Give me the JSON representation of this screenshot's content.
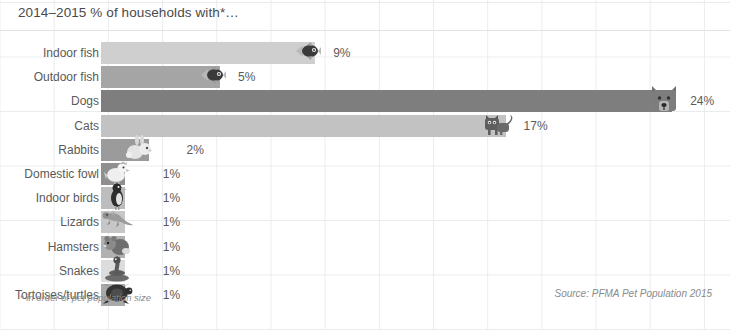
{
  "chart_data": {
    "type": "bar",
    "orientation": "horizontal",
    "title": "2014–2015 % of households with*…",
    "xlabel": "",
    "ylabel": "",
    "xlim": [
      0,
      26
    ],
    "grid": true,
    "legend": "none",
    "categories": [
      "Indoor fish",
      "Outdoor fish",
      "Dogs",
      "Cats",
      "Rabbits",
      "Domestic fowl",
      "Indoor birds",
      "Lizards",
      "Hamsters",
      "Snakes",
      "Tortoises/turtles"
    ],
    "values": [
      9,
      5,
      24,
      17,
      2,
      1,
      1,
      1,
      1,
      1,
      1
    ],
    "value_labels": [
      "9%",
      "5%",
      "24%",
      "17%",
      "2%",
      "1%",
      "1%",
      "1%",
      "1%",
      "1%",
      "1%"
    ],
    "bar_colors": [
      "#cfcfcf",
      "#a5a5a5",
      "#7e7e7e",
      "#c2c2c2",
      "#9b9b9b",
      "#8f8f8f",
      "#bdbdbd",
      "#c6c6c6",
      "#b1b1b1",
      "#dcdcdc",
      "#a9a9a9"
    ],
    "icons": [
      "fish-icon",
      "fish-icon",
      "dog-icon",
      "cat-icon",
      "rabbit-icon",
      "chicken-icon",
      "bird-icon",
      "lizard-icon",
      "hamster-icon",
      "snake-icon",
      "tortoise-icon"
    ],
    "annotations": {
      "footnote": "* in order of pet population size",
      "source": "Source: PFMA Pet Population 2015"
    }
  },
  "colors": {
    "grid": "#e9ecef",
    "text": "#5a5a5a",
    "title_text": "#4a4a4a",
    "muted_text": "#8a8a8a",
    "background": "#ffffff"
  }
}
